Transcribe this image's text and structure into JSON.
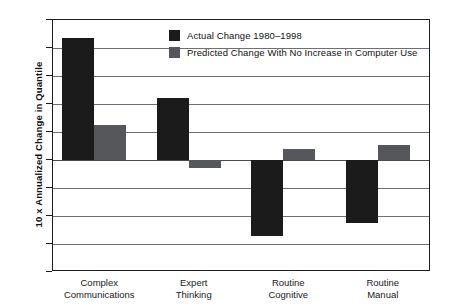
{
  "chart_data": {
    "type": "bar",
    "title": "",
    "subtitle": "",
    "xlabel": "",
    "ylabel": "10 x Annualized Change in Quantile",
    "ylim": [
      -4,
      5
    ],
    "ytick_labels": [
      "5",
      "4",
      "3",
      "2",
      "1",
      "0",
      "–1",
      "–2",
      "–3",
      "–4"
    ],
    "ytick_values": [
      5,
      4,
      3,
      2,
      1,
      0,
      -1,
      -2,
      -3,
      -4
    ],
    "grid": true,
    "legend_position": "top-center",
    "categories": [
      "Complex Communications",
      "Expert Thinking",
      "Routine Cognitive",
      "Routine Manual"
    ],
    "category_lines": [
      [
        "Complex",
        "Communications"
      ],
      [
        "Expert",
        "Thinking"
      ],
      [
        "Routine",
        "Cognitive"
      ],
      [
        "Routine",
        "Manual"
      ]
    ],
    "series": [
      {
        "name": "Actual Change 1980–1998",
        "color": "#1b1b1b",
        "values": [
          4.35,
          2.2,
          -2.7,
          -2.25
        ]
      },
      {
        "name": "Predicted Change With No Increase in Computer Use",
        "color": "#55575a",
        "values": [
          1.25,
          -0.3,
          0.38,
          0.52
        ]
      }
    ]
  },
  "legend": {
    "items": [
      {
        "label": "Actual Change 1980–1998",
        "color": "#1b1b1b"
      },
      {
        "label": "Predicted Change With No Increase in Computer Use",
        "color": "#55575a"
      }
    ]
  },
  "axis": {
    "y_title": "10 x Annualized Change in Quantile"
  }
}
